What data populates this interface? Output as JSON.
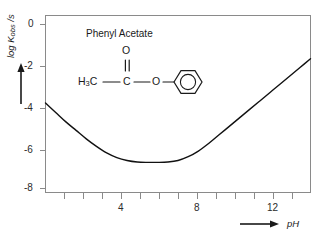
{
  "chart_data": {
    "type": "line",
    "title": "",
    "annotation_label": "Phenyl Acetate",
    "xlabel": "pH",
    "ylabel": "log Kobs /s",
    "ylabel_parts": {
      "prefix": "log K",
      "sub": "obs",
      "suffix": " /s"
    },
    "xlim": [
      1,
      14
    ],
    "ylim": [
      -8.8,
      0.6
    ],
    "xticks": [
      1,
      2,
      3,
      4,
      5,
      6,
      7,
      8,
      9,
      10,
      11,
      12,
      13,
      14
    ],
    "xtick_labels": [
      "",
      "",
      "",
      "4",
      "",
      "",
      "",
      "8",
      "",
      "",
      "",
      "12",
      "",
      ""
    ],
    "yticks": [
      0,
      -2,
      -4,
      -6,
      -8
    ],
    "ytick_labels": [
      "0",
      "-2",
      "-4",
      "-6",
      "-8"
    ],
    "grid": false,
    "legend": false,
    "line_color": "#111111",
    "axis_color": "#8a8a8a",
    "series": [
      {
        "name": "log kobs vs pH",
        "x": [
          1.0,
          1.5,
          2.0,
          2.5,
          3.0,
          3.5,
          4.0,
          4.5,
          5.0,
          5.5,
          6.0,
          6.5,
          7.0,
          7.5,
          8.0,
          8.5,
          9.0,
          9.5,
          10.0,
          10.5,
          11.0,
          11.5,
          12.0,
          12.5,
          13.0,
          13.5,
          14.0
        ],
        "y": [
          -4.05,
          -4.55,
          -5.05,
          -5.5,
          -5.95,
          -6.35,
          -6.7,
          -6.95,
          -7.1,
          -7.18,
          -7.2,
          -7.2,
          -7.18,
          -7.1,
          -6.9,
          -6.6,
          -6.2,
          -5.75,
          -5.3,
          -4.85,
          -4.4,
          -3.95,
          -3.5,
          -3.05,
          -2.6,
          -2.15,
          -1.7
        ]
      }
    ]
  },
  "structure": {
    "title": "Phenyl Acetate",
    "carbonyl_oxygen": "O",
    "methyl": {
      "text": "H",
      "sub": "3",
      "tail": "C"
    },
    "carbonyl_carbon": "C",
    "ester_oxygen": "O",
    "ring": "benzene-ring"
  },
  "axis_arrows": {
    "y_arrow": "up-arrow",
    "x_arrow": "right-arrow"
  }
}
